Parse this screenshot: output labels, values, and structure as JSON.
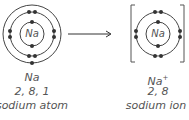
{
  "atom": {
    "symbol": "Na",
    "config": "2, 8, 1",
    "name": "sodium atom"
  },
  "ion": {
    "symbol": "Na",
    "charge": "+",
    "config": "2, 8",
    "name": "sodium ion"
  },
  "colors": {
    "line": "#444444",
    "electron": "#333333"
  }
}
